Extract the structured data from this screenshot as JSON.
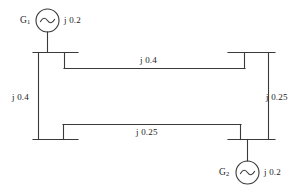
{
  "diagram": {
    "stroke_color": "#3a3a3a",
    "text_color": "#1a1a1a",
    "background_color": "#ffffff",
    "generators": [
      {
        "id": "g1",
        "name_main": "G",
        "name_sub": "1",
        "label": "G1",
        "reactance": "j 0.2",
        "symbol": "sine-wave",
        "position": "top-left"
      },
      {
        "id": "g2",
        "name_main": "G",
        "name_sub": "2",
        "label": "G2",
        "reactance": "j 0.2",
        "symbol": "sine-wave",
        "position": "bottom-right"
      }
    ],
    "branches": [
      {
        "id": "top-line",
        "reactance": "j 0.4",
        "orientation": "horizontal",
        "position": "top"
      },
      {
        "id": "left-line",
        "reactance": "j 0.4",
        "orientation": "vertical",
        "position": "left"
      },
      {
        "id": "right-line",
        "reactance": "j 0.25",
        "orientation": "vertical",
        "position": "right"
      },
      {
        "id": "bottom-line",
        "reactance": "j 0.25",
        "orientation": "horizontal",
        "position": "bottom"
      }
    ],
    "buses": [
      {
        "id": "bus-top-left",
        "label": ""
      },
      {
        "id": "bus-top-right",
        "label": ""
      },
      {
        "id": "bus-bottom-left",
        "label": ""
      },
      {
        "id": "bus-bottom-right",
        "label": ""
      }
    ]
  }
}
